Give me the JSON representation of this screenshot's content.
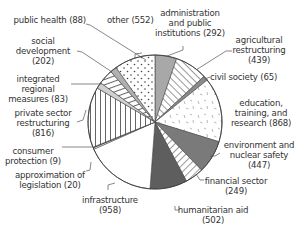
{
  "chart_data": {
    "type": "pie",
    "title": "",
    "start_angle_deg": 0,
    "direction": "clockwise",
    "total": 5590,
    "slices": [
      {
        "key": "administration",
        "label": "administration and public institutions",
        "value": 292,
        "pattern": "solid",
        "color": "#a8a8a8"
      },
      {
        "key": "agricultural",
        "label": "agricultural restructuring",
        "value": 439,
        "pattern": "diagonal-stripes",
        "color": "#ffffff"
      },
      {
        "key": "civil",
        "label": "civil society",
        "value": 65,
        "pattern": "solid",
        "color": "#8a8a8a"
      },
      {
        "key": "education",
        "label": "education, training, and research",
        "value": 868,
        "pattern": "dashes",
        "color": "#ffffff"
      },
      {
        "key": "environment",
        "label": "environment and nuclear safety",
        "value": 447,
        "pattern": "solid",
        "color": "#7a7a7a"
      },
      {
        "key": "financial",
        "label": "financial sector",
        "value": 249,
        "pattern": "diagonal-stripes",
        "color": "#ffffff"
      },
      {
        "key": "humanitarian",
        "label": "humanitarian aid",
        "value": 502,
        "pattern": "solid",
        "color": "#5e5e5e"
      },
      {
        "key": "infrastructure",
        "label": "infrastructure",
        "value": 958,
        "pattern": "solid",
        "color": "#ffffff"
      },
      {
        "key": "approximation",
        "label": "approximation of legislation",
        "value": 20,
        "pattern": "solid",
        "color": "#ffffff"
      },
      {
        "key": "consumer",
        "label": "consumer protection",
        "value": 9,
        "pattern": "solid",
        "color": "#333333"
      },
      {
        "key": "private",
        "label": "private sector restructuring",
        "value": 816,
        "pattern": "vertical-stripes",
        "color": "#ffffff"
      },
      {
        "key": "integrated",
        "label": "integrated regional measures",
        "value": 83,
        "pattern": "solid",
        "color": "#d0d0d0"
      },
      {
        "key": "social",
        "label": "social development",
        "value": 202,
        "pattern": "horizontal-stripes",
        "color": "#ffffff"
      },
      {
        "key": "public_health",
        "label": "public health",
        "value": 88,
        "pattern": "solid",
        "color": "#b0b0b0"
      },
      {
        "key": "other",
        "label": "other",
        "value": 552,
        "pattern": "dots",
        "color": "#ffffff"
      }
    ]
  },
  "labels": {
    "public_health": "public health (88)",
    "social_1": "social",
    "social_2": "development",
    "social_3": "(202)",
    "integrated_1": "integrated",
    "integrated_2": "regional",
    "integrated_3": "measures (83)",
    "private_1": "private sector",
    "private_2": "restructuring",
    "private_3": "(816)",
    "consumer_1": "consumer",
    "consumer_2": "protection (9)",
    "approx_1": "approximation of",
    "approx_2": "legislation (20)",
    "infra_1": "infrastructure",
    "infra_2": "(958)",
    "other": "other (552)",
    "admin_1": "administration",
    "admin_2": "and public",
    "admin_3": "institutions (292)",
    "agri_1": "agricultural",
    "agri_2": "restructuring",
    "agri_3": "(439)",
    "civil": "civil society (65)",
    "edu_1": "education,",
    "edu_2": "training, and",
    "edu_3": "research (868)",
    "env_1": "environment and",
    "env_2": "nuclear safety",
    "env_3": "(447)",
    "fin_1": "financial sector",
    "fin_2": "(249)",
    "hum_1": "humanitarian aid",
    "hum_2": "(502)"
  }
}
